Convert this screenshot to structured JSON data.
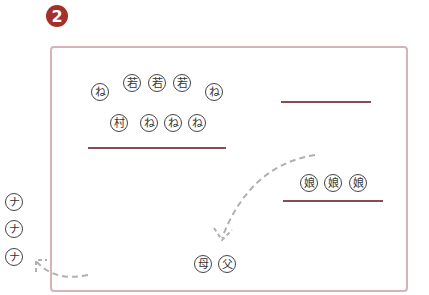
{
  "badge": {
    "number": "2",
    "color": "#a3302a"
  },
  "frame": {
    "border_color": "#d6b3b8"
  },
  "groups": {
    "top_left_row1": [
      "ね",
      "若",
      "若",
      "若",
      "ね"
    ],
    "top_left_row2": [
      "村",
      "ね",
      "ね",
      "ね"
    ],
    "right_group": [
      "娘",
      "娘",
      "娘"
    ],
    "bottom_center": [
      "母",
      "父"
    ],
    "outside_left": [
      "ナ",
      "ナ",
      "ナ"
    ]
  },
  "lines": {
    "color": "#8a4a4f"
  },
  "arrows": {
    "style": "dashed",
    "color": "#b0b0b0"
  }
}
